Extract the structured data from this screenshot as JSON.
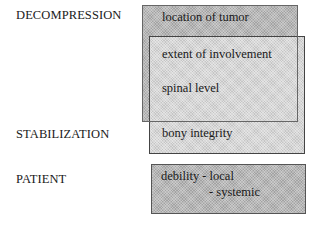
{
  "diagram": {
    "categories": [
      {
        "id": "decompression",
        "label": "DECOMPRESSION"
      },
      {
        "id": "stabilization",
        "label": "STABILIZATION"
      },
      {
        "id": "patient",
        "label": "PATIENT"
      }
    ],
    "boxes": {
      "decompression": {
        "text": "location of tumor"
      },
      "overlap": {
        "line1": "extent of involvement",
        "line2": "spinal level"
      },
      "stabilization": {
        "text": "bony integrity"
      },
      "patient": {
        "line1": "debility - local",
        "line2": "- systemic"
      }
    },
    "colors": {
      "dark_fill": "#b8b8b8",
      "light_fill": "#d6d6d6",
      "border": "#555555",
      "text": "#1a1a1a"
    }
  }
}
